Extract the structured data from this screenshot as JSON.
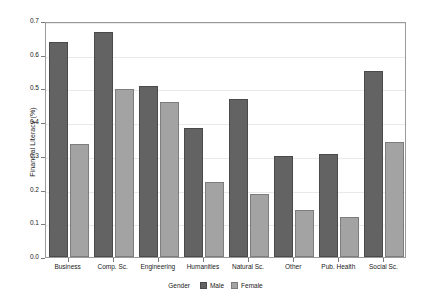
{
  "chart_data": {
    "type": "bar",
    "title": "",
    "xlabel": "",
    "ylabel": "Financial Literacy (%)",
    "ylim": [
      0.0,
      0.7
    ],
    "yticks": [
      "0.0",
      "0.1",
      "0.2",
      "0.3",
      "0.4",
      "0.5",
      "0.6",
      "0.7"
    ],
    "ytick_values": [
      0.0,
      0.1,
      0.2,
      0.3,
      0.4,
      0.5,
      0.6,
      0.7
    ],
    "grid": true,
    "legend_position": "bottom",
    "legend_title": "Gender",
    "categories": [
      "Business",
      "Comp. Sc.",
      "Engineering",
      "Humanities",
      "Natural Sc.",
      "Other",
      "Pub. Health",
      "Social Sc."
    ],
    "series": [
      {
        "name": "Male",
        "color": "#636363",
        "values": [
          0.638,
          0.667,
          0.507,
          0.383,
          0.47,
          0.299,
          0.306,
          0.551
        ]
      },
      {
        "name": "Female",
        "color": "#a3a3a3",
        "values": [
          0.336,
          0.499,
          0.46,
          0.223,
          0.186,
          0.14,
          0.12,
          0.342
        ]
      }
    ]
  },
  "legend": {
    "title": "Gender",
    "entries": [
      {
        "label": "Male",
        "swatch": "male"
      },
      {
        "label": "Female",
        "swatch": "female"
      }
    ]
  }
}
